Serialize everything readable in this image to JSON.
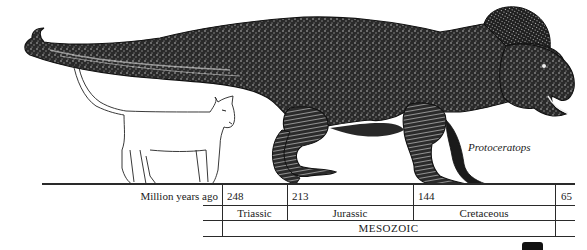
{
  "figure": {
    "species_label": "Protoceratops",
    "comparison_animal": "cat",
    "subject_animal": "dinosaur"
  },
  "timeline": {
    "axis_label": "Million years ago",
    "ticks": [
      {
        "value": "248",
        "x": 222
      },
      {
        "value": "213",
        "x": 287
      },
      {
        "value": "144",
        "x": 413
      },
      {
        "value": "65",
        "x": 555
      }
    ],
    "periods": [
      {
        "name": "Triassic",
        "from": "248",
        "to": "213"
      },
      {
        "name": "Jurassic",
        "from": "213",
        "to": "144"
      },
      {
        "name": "Cretaceous",
        "from": "144",
        "to": "65"
      }
    ],
    "era": {
      "name": "MESOZOIC",
      "from": "248",
      "to": "65"
    }
  },
  "colors": {
    "ink": "#1a1a1a",
    "paper": "#ffffff"
  }
}
